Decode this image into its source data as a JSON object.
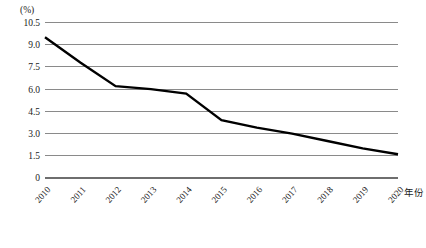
{
  "chart_data": {
    "type": "line",
    "title": "",
    "subtitle": "",
    "xlabel": "年份",
    "ylabel": "(%)",
    "unit_label": "(%)",
    "categories": [
      "2010",
      "2011",
      "2012",
      "2013",
      "2014",
      "2015",
      "2016",
      "2017",
      "2018",
      "2019",
      "2020"
    ],
    "x": [
      2010,
      2011,
      2012,
      2013,
      2014,
      2015,
      2016,
      2017,
      2018,
      2019,
      2020
    ],
    "values": [
      9.5,
      7.8,
      6.2,
      6.0,
      5.7,
      3.9,
      3.4,
      3.0,
      2.5,
      2.0,
      1.6
    ],
    "series": [
      {
        "name": "",
        "values": [
          9.5,
          7.8,
          6.2,
          6.0,
          5.7,
          3.9,
          3.4,
          3.0,
          2.5,
          2.0,
          1.6
        ]
      }
    ],
    "ylim": [
      0,
      10.5
    ],
    "yticks": [
      "0",
      "1.5",
      "3.0",
      "4.5",
      "6.0",
      "7.5",
      "9.0",
      "10.5"
    ],
    "ytick_values": [
      0,
      1.5,
      3.0,
      4.5,
      6.0,
      7.5,
      9.0,
      10.5
    ],
    "xlim": [
      2010,
      2020
    ],
    "grid": "horizontal",
    "legend": "none",
    "line_color": "#000000",
    "grid_color": "#8a8a8a",
    "axis_color": "#6e6e6e",
    "background_color": "#ffffff",
    "xtick_rotation": -48,
    "annotations": []
  }
}
